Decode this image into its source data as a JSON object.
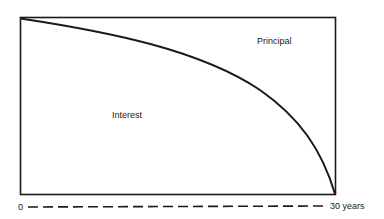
{
  "diagram": {
    "title": "",
    "regions": {
      "upper_right": "Principal",
      "lower_left": "Interest"
    },
    "axis": {
      "start_label": "0",
      "end_label": "30 years"
    },
    "colors": {
      "line": "#1a1a1a",
      "background": "#ffffff"
    }
  }
}
